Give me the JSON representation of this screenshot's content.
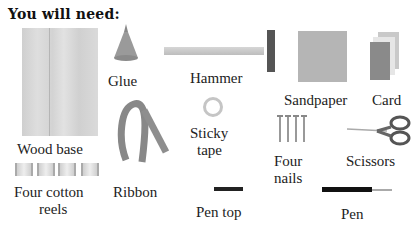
{
  "heading": "You will need:",
  "items": [
    {
      "id": "wood-base",
      "label": "Wood base"
    },
    {
      "id": "glue",
      "label": "Glue"
    },
    {
      "id": "hammer",
      "label": "Hammer"
    },
    {
      "id": "sandpaper",
      "label": "Sandpaper"
    },
    {
      "id": "card",
      "label": "Card"
    },
    {
      "id": "ribbon",
      "label": "Ribbon"
    },
    {
      "id": "sticky-tape",
      "label_line1": "Sticky",
      "label_line2": "tape"
    },
    {
      "id": "four-nails",
      "label_line1": "Four",
      "label_line2": "nails"
    },
    {
      "id": "scissors",
      "label": "Scissors"
    },
    {
      "id": "cotton-reels",
      "label_line1": "Four cotton",
      "label_line2": "reels"
    },
    {
      "id": "pen-top",
      "label": "Pen top"
    },
    {
      "id": "pen",
      "label": "Pen"
    }
  ],
  "colors": {
    "background": "#ffffff",
    "text": "#1a1a1a",
    "item_gray": "#b5b5b5"
  }
}
